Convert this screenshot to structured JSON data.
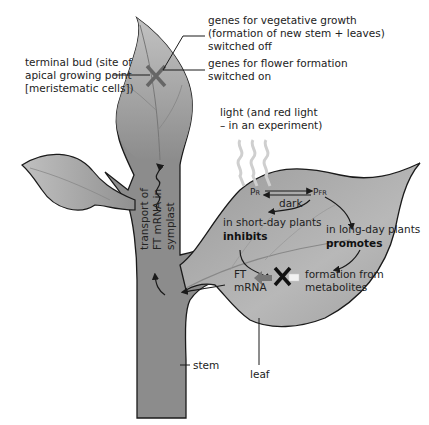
{
  "labels": {
    "terminal_bud": [
      "terminal bud (site of",
      "apical growing point",
      "[meristematic cells])"
    ],
    "veg_genes": [
      "genes for vegetative growth",
      "(formation of new stem + leaves)",
      "switched off"
    ],
    "flower_genes": [
      "genes for flower formation",
      "switched on"
    ],
    "light": [
      "light (and red light",
      "– in an experiment)"
    ],
    "pr": "P",
    "pr_sub": "R",
    "pfr": "P",
    "pfr_sub": "FR",
    "dark": "dark",
    "short_day": "in short-day plants",
    "inhibits": "inhibits",
    "long_day": "in long-day plants",
    "promotes": "promotes",
    "ft_mrna": [
      "FT",
      "mRNA"
    ],
    "formation": [
      "formation from",
      "metabolites"
    ],
    "transport": [
      "transport of",
      "FT mRNA in",
      "symplast"
    ],
    "stem": "stem",
    "leaf": "leaf"
  },
  "colors": {
    "plant_fill": "#8c8c8c",
    "leaf_light": "#b5b5b5",
    "outline": "#1a1a1a",
    "text": "#222222"
  }
}
